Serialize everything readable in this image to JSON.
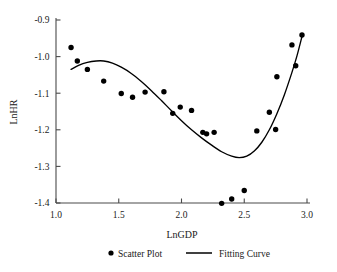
{
  "chart_data": {
    "type": "scatter",
    "title": "",
    "xlabel": "LnGDP",
    "ylabel": "LnHR",
    "xlim": [
      1.0,
      3.0
    ],
    "ylim": [
      -1.4,
      -0.9
    ],
    "xticks": [
      "1.0",
      "1.5",
      "2.0",
      "2.5",
      "3.0"
    ],
    "xtick_values": [
      1.0,
      1.5,
      2.0,
      2.5,
      3.0
    ],
    "yticks": [
      "-0.9",
      "-1.0",
      "-1.1",
      "-1.2",
      "-1.3",
      "-1.4"
    ],
    "ytick_values": [
      -0.9,
      -1.0,
      -1.1,
      -1.2,
      -1.3,
      -1.4
    ],
    "grid": false,
    "legend_position": "bottom",
    "series": [
      {
        "name": "Scatter Plot",
        "type": "scatter",
        "marker": "circle",
        "color": "#000000",
        "points": [
          [
            1.12,
            -0.975
          ],
          [
            1.17,
            -1.012
          ],
          [
            1.25,
            -1.035
          ],
          [
            1.38,
            -1.067
          ],
          [
            1.52,
            -1.101
          ],
          [
            1.61,
            -1.111
          ],
          [
            1.71,
            -1.097
          ],
          [
            1.86,
            -1.096
          ],
          [
            1.93,
            -1.155
          ],
          [
            1.99,
            -1.138
          ],
          [
            2.08,
            -1.147
          ],
          [
            2.17,
            -1.207
          ],
          [
            2.2,
            -1.211
          ],
          [
            2.26,
            -1.207
          ],
          [
            2.32,
            -1.401
          ],
          [
            2.4,
            -1.389
          ],
          [
            2.5,
            -1.366
          ],
          [
            2.6,
            -1.203
          ],
          [
            2.7,
            -1.152
          ],
          [
            2.75,
            -1.199
          ],
          [
            2.76,
            -1.055
          ],
          [
            2.88,
            -0.968
          ],
          [
            2.91,
            -1.025
          ],
          [
            2.96,
            -0.941
          ]
        ]
      },
      {
        "name": "Fitting Curve",
        "type": "line",
        "color": "#000000",
        "points": [
          [
            1.12,
            -1.035
          ],
          [
            1.18,
            -1.024
          ],
          [
            1.25,
            -1.016
          ],
          [
            1.32,
            -1.012
          ],
          [
            1.38,
            -1.012
          ],
          [
            1.45,
            -1.018
          ],
          [
            1.52,
            -1.029
          ],
          [
            1.6,
            -1.046
          ],
          [
            1.68,
            -1.068
          ],
          [
            1.76,
            -1.093
          ],
          [
            1.84,
            -1.12
          ],
          [
            1.92,
            -1.148
          ],
          [
            2.0,
            -1.175
          ],
          [
            2.08,
            -1.2
          ],
          [
            2.16,
            -1.222
          ],
          [
            2.24,
            -1.242
          ],
          [
            2.32,
            -1.26
          ],
          [
            2.4,
            -1.272
          ],
          [
            2.46,
            -1.276
          ],
          [
            2.52,
            -1.272
          ],
          [
            2.58,
            -1.258
          ],
          [
            2.64,
            -1.234
          ],
          [
            2.7,
            -1.2
          ],
          [
            2.76,
            -1.156
          ],
          [
            2.82,
            -1.104
          ],
          [
            2.88,
            -1.043
          ],
          [
            2.92,
            -0.998
          ],
          [
            2.96,
            -0.945
          ]
        ]
      }
    ]
  },
  "legend": {
    "scatter_label": "Scatter Plot",
    "curve_label": "Fitting Curve"
  }
}
